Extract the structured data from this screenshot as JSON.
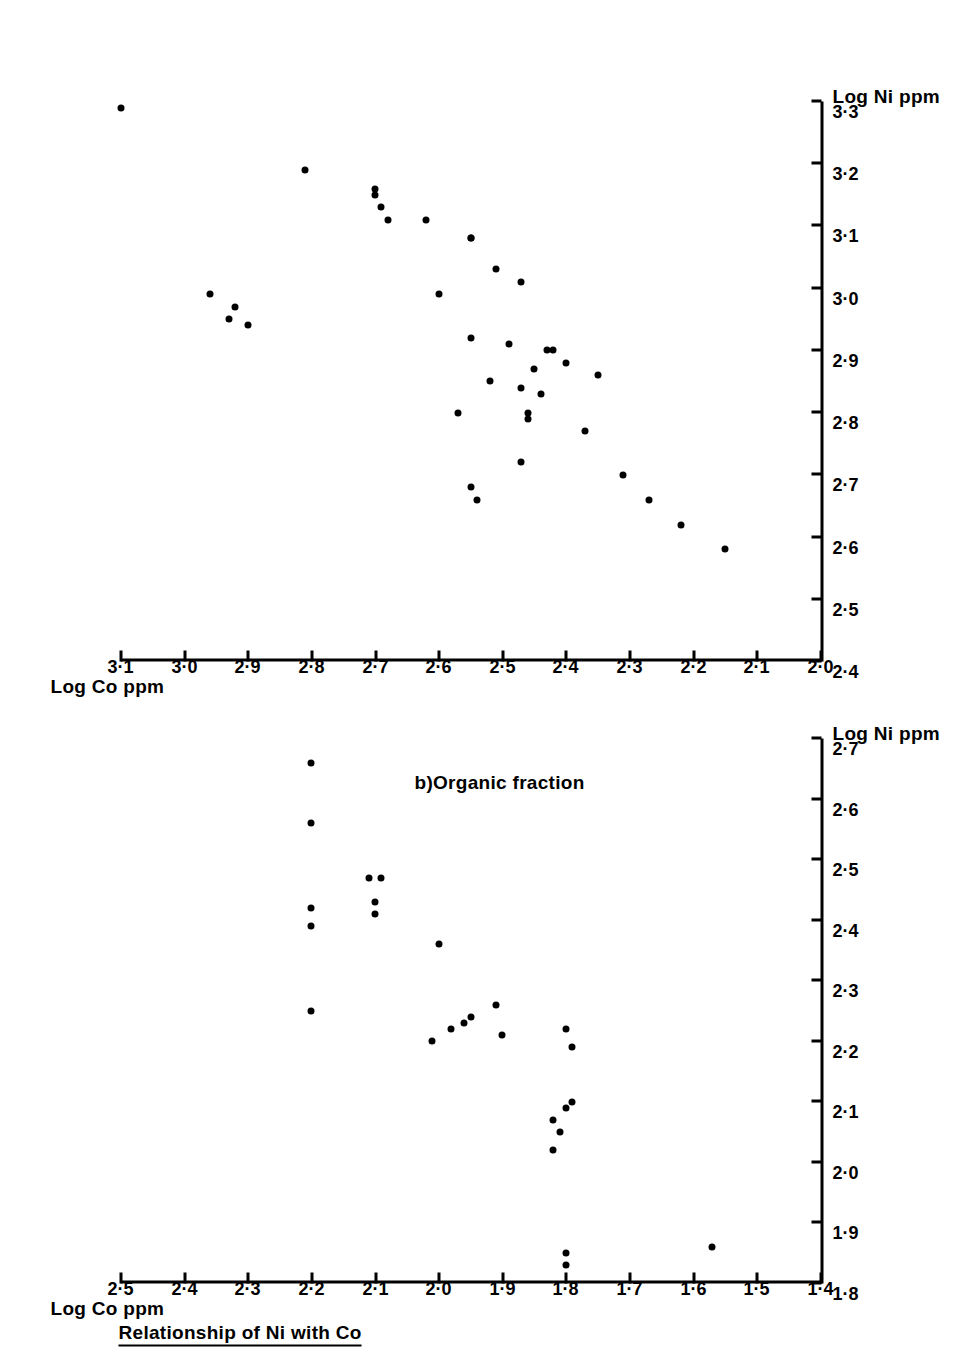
{
  "figure": {
    "title": "Relationship of Ni with Co",
    "panels": [
      {
        "caption": "a)Inorganic fraction"
      },
      {
        "caption": "b)Organic fraction"
      }
    ]
  },
  "chart_data": [
    {
      "type": "scatter",
      "title": "a)Inorganic fraction",
      "xlabel": "Log Ni ppm",
      "ylabel": "Log Co ppm",
      "xlim": [
        1.8,
        2.7
      ],
      "ylim": [
        1.4,
        2.5
      ],
      "xticks": [
        "1·8",
        "1·9",
        "2·0",
        "2·1",
        "2·2",
        "2·3",
        "2·4",
        "2·5",
        "2·6",
        "2·7"
      ],
      "yticks": [
        "1·4",
        "1·5",
        "1·6",
        "1·7",
        "1·8",
        "1·9",
        "2·0",
        "2·1",
        "2·2",
        "2·3",
        "2·4",
        "2·5"
      ],
      "grid": false,
      "legend": "none",
      "points": [
        [
          2.66,
          2.2
        ],
        [
          2.56,
          2.2
        ],
        [
          2.47,
          2.11
        ],
        [
          2.47,
          2.09
        ],
        [
          2.42,
          2.2
        ],
        [
          2.41,
          2.1
        ],
        [
          2.43,
          2.1
        ],
        [
          2.39,
          2.2
        ],
        [
          2.36,
          2.0
        ],
        [
          2.26,
          1.91
        ],
        [
          2.21,
          1.9
        ],
        [
          2.2,
          2.01
        ],
        [
          2.22,
          1.98
        ],
        [
          2.23,
          1.96
        ],
        [
          2.24,
          1.95
        ],
        [
          2.25,
          2.2
        ],
        [
          2.22,
          1.8
        ],
        [
          2.19,
          1.79
        ],
        [
          2.09,
          1.8
        ],
        [
          2.1,
          1.79
        ],
        [
          2.02,
          1.82
        ],
        [
          2.05,
          1.81
        ],
        [
          2.07,
          1.82
        ],
        [
          1.83,
          1.8
        ],
        [
          1.85,
          1.8
        ],
        [
          1.86,
          1.57
        ]
      ]
    },
    {
      "type": "scatter",
      "title": "b)Organic fraction",
      "xlabel": "Log Ni ppm",
      "ylabel": "Log Co ppm",
      "xlim": [
        2.4,
        3.3
      ],
      "ylim": [
        2.0,
        3.1
      ],
      "xticks": [
        "2·4",
        "2·5",
        "2·6",
        "2·7",
        "2·8",
        "2·9",
        "3·0",
        "3·1",
        "3·2",
        "3·3"
      ],
      "yticks": [
        "2·0",
        "2·1",
        "2·2",
        "2·3",
        "2·4",
        "2·5",
        "2·6",
        "2·7",
        "2·8",
        "2·9",
        "3·0",
        "3·1"
      ],
      "grid": false,
      "legend": "none",
      "points": [
        [
          3.29,
          3.1
        ],
        [
          3.19,
          2.81
        ],
        [
          3.15,
          2.7
        ],
        [
          3.16,
          2.7
        ],
        [
          3.13,
          2.69
        ],
        [
          3.11,
          2.68
        ],
        [
          3.11,
          2.62
        ],
        [
          3.08,
          2.55
        ],
        [
          3.08,
          2.55
        ],
        [
          3.03,
          2.51
        ],
        [
          3.01,
          2.47
        ],
        [
          2.99,
          2.96
        ],
        [
          2.99,
          2.6
        ],
        [
          2.97,
          2.92
        ],
        [
          2.95,
          2.93
        ],
        [
          2.94,
          2.9
        ],
        [
          2.92,
          2.55
        ],
        [
          2.91,
          2.49
        ],
        [
          2.9,
          2.43
        ],
        [
          2.9,
          2.42
        ],
        [
          2.88,
          2.4
        ],
        [
          2.87,
          2.45
        ],
        [
          2.86,
          2.35
        ],
        [
          2.85,
          2.52
        ],
        [
          2.84,
          2.47
        ],
        [
          2.83,
          2.44
        ],
        [
          2.8,
          2.57
        ],
        [
          2.8,
          2.46
        ],
        [
          2.79,
          2.46
        ],
        [
          2.77,
          2.37
        ],
        [
          2.72,
          2.47
        ],
        [
          2.7,
          2.31
        ],
        [
          2.68,
          2.55
        ],
        [
          2.66,
          2.54
        ],
        [
          2.66,
          2.27
        ],
        [
          2.62,
          2.22
        ],
        [
          2.58,
          2.15
        ]
      ]
    }
  ]
}
